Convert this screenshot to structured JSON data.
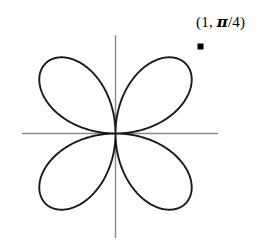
{
  "figure": {
    "background_color": "#ffffff",
    "curve_color": "#1a1a1a",
    "axis_color": "#8c8c8c",
    "marker_color": "#000000",
    "annotation": {
      "prefix": "(1, ",
      "pi": "π",
      "suffix": "/4)",
      "full_text": "(1, π/4)"
    }
  },
  "chart_data": {
    "type": "line",
    "title": "",
    "xlabel": "",
    "ylabel": "",
    "plot_kind": "polar-rose",
    "equation": "r = cos(2θ)",
    "petal_count": 4,
    "petal_angles_deg": [
      45,
      135,
      225,
      315
    ],
    "max_radius": 1,
    "xlim": [
      -1.15,
      1.15
    ],
    "ylim": [
      -1.15,
      1.15
    ],
    "grid": false,
    "legend": null,
    "axes_shown": [
      "x-axis",
      "y-axis"
    ],
    "annotations": [
      {
        "label": "(1, π/4)",
        "r": 1,
        "theta": "π/4",
        "theta_deg": 45,
        "x": 0.7071,
        "y": 0.7071,
        "marker": "square"
      }
    ],
    "theta_range_deg": [
      0,
      360
    ],
    "x": [
      1,
      0.9781,
      0.9135,
      0.809,
      0.6691,
      0.5,
      0.309,
      0.1045,
      -0.1045,
      -0.309,
      -0.5,
      -0.6691,
      -0.809,
      -0.9135,
      -0.9781,
      -1,
      -0.9781,
      -0.9135,
      -0.809,
      -0.6691,
      -0.5,
      -0.309,
      -0.1045,
      0.1045,
      0.309,
      0.5,
      0.6691,
      0.809,
      0.9135,
      0.9781,
      1
    ],
    "y": [
      0,
      0.1724,
      0.3169,
      0.4045,
      0.4243,
      0.375,
      0.2679,
      0.133,
      -0.133,
      -0.2679,
      -0.375,
      -0.4243,
      -0.4045,
      -0.3169,
      -0.1724,
      0,
      0.1724,
      0.3169,
      0.4045,
      0.4243,
      0.375,
      0.2679,
      0.133,
      -0.133,
      -0.2679,
      -0.375,
      -0.4243,
      -0.4045,
      -0.3169,
      -0.1724,
      0
    ]
  }
}
